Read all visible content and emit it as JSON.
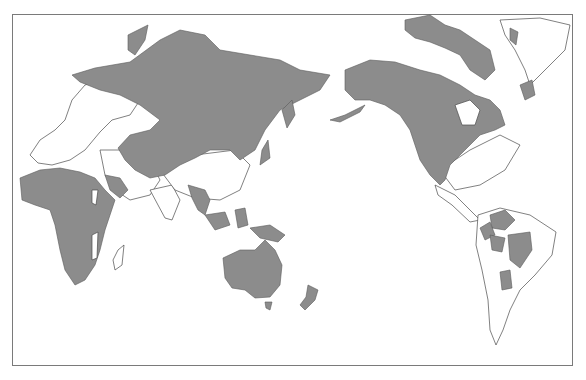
{
  "map": {
    "projection": "pacific-centered-world",
    "colors": {
      "background": "#ffffff",
      "frame": "#7a7a7a",
      "shaded_region": "#8c8c8c",
      "coastline": "#4a4a4a"
    },
    "shaded_regions": [
      "northern-eurasia",
      "central-asia",
      "north-america",
      "arctic-islands",
      "greenland-coast",
      "africa",
      "arabian-peninsula",
      "southeast-asia",
      "indonesia",
      "new-guinea",
      "australia",
      "tasmania",
      "new-zealand",
      "south-america-patches"
    ]
  }
}
